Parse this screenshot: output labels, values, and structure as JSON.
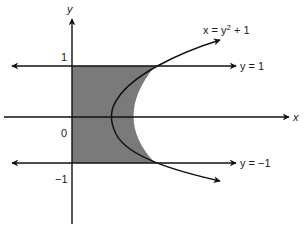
{
  "diagram": {
    "title": "",
    "axes": {
      "x_label": "x",
      "y_label": "y"
    },
    "ticks": {
      "y_one": "1",
      "origin": "0",
      "y_neg_one": "−1"
    },
    "curves": {
      "parabola_label_prefix": "x = y",
      "parabola_label_exp": "2",
      "parabola_label_suffix": " + 1",
      "line_top_label": "y = 1",
      "line_bottom_label": "y = −1"
    },
    "colors": {
      "shade": "#7a7a7a",
      "stroke": "#111111",
      "background": "#ffffff"
    },
    "region": "Shaded region bounded by y-axis, y = 1, y = −1, and x = y² + 1"
  }
}
